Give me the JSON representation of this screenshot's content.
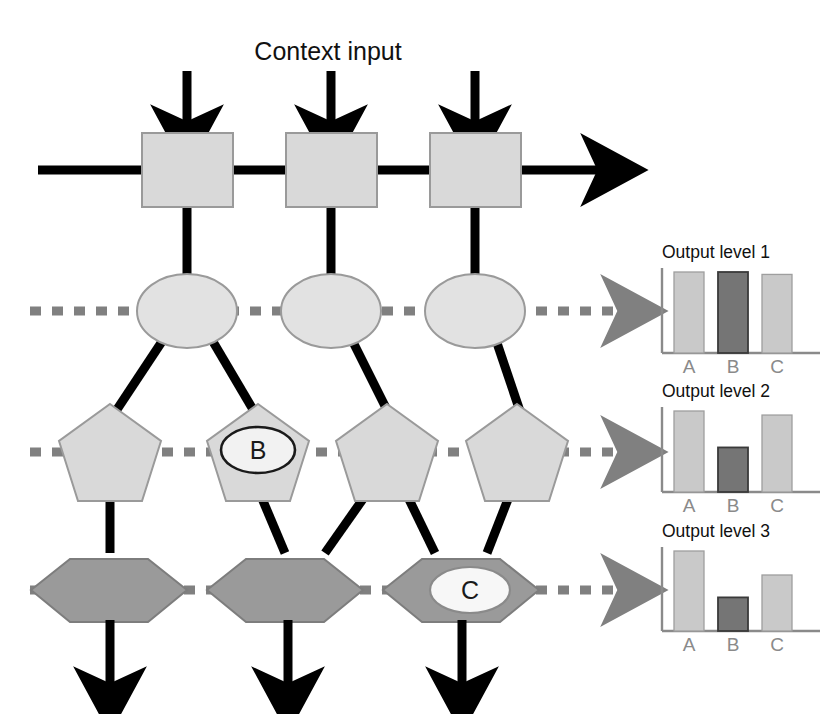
{
  "figure": {
    "context_label": "Context input",
    "colors": {
      "light_fill": "#d9d9d9",
      "dark_fill": "#9a9a9a",
      "stroke_black": "#000000",
      "stroke_gray": "#808080",
      "axis_gray": "#8a8a8a",
      "bar_light": "#c9c9c9",
      "bar_dark": "#757575",
      "background": "#ffffff"
    }
  },
  "layers": [
    {
      "name": "context-layer",
      "shape": "rectangle",
      "count": 3,
      "nodes": [
        {
          "id": "box-1",
          "label": ""
        },
        {
          "id": "box-2",
          "label": ""
        },
        {
          "id": "box-3",
          "label": ""
        }
      ]
    },
    {
      "name": "level-1-layer",
      "shape": "ellipse",
      "count": 3,
      "nodes": [
        {
          "id": "ellipse-1",
          "label": ""
        },
        {
          "id": "ellipse-2",
          "label": ""
        },
        {
          "id": "ellipse-3",
          "label": ""
        }
      ]
    },
    {
      "name": "level-2-layer",
      "shape": "pentagon",
      "count": 4,
      "nodes": [
        {
          "id": "pentagon-1",
          "label": ""
        },
        {
          "id": "pentagon-2",
          "label": "B"
        },
        {
          "id": "pentagon-3",
          "label": ""
        },
        {
          "id": "pentagon-4",
          "label": ""
        }
      ]
    },
    {
      "name": "level-3-layer",
      "shape": "hexagon",
      "count": 3,
      "nodes": [
        {
          "id": "hexagon-1",
          "label": ""
        },
        {
          "id": "hexagon-2",
          "label": ""
        },
        {
          "id": "hexagon-3",
          "label": "C"
        }
      ]
    }
  ],
  "node_labels": {
    "pentagon_b": "B",
    "hexagon_c": "C"
  },
  "chart_data": [
    {
      "id": "output-level-1",
      "type": "bar",
      "title": "Output level 1",
      "categories": [
        "A",
        "B",
        "C"
      ],
      "values": [
        100,
        100,
        97
      ],
      "ylim": [
        0,
        115
      ],
      "bar_styles": [
        "light",
        "dark",
        "light"
      ],
      "xlabel": "",
      "ylabel": "",
      "grid": false,
      "legend": false
    },
    {
      "id": "output-level-2",
      "type": "bar",
      "title": "Output level 2",
      "categories": [
        "A",
        "B",
        "C"
      ],
      "values": [
        100,
        55,
        95
      ],
      "ylim": [
        0,
        115
      ],
      "bar_styles": [
        "light",
        "dark",
        "light"
      ],
      "xlabel": "",
      "ylabel": "",
      "grid": false,
      "legend": false
    },
    {
      "id": "output-level-3",
      "type": "bar",
      "title": "Output level 3",
      "categories": [
        "A",
        "B",
        "C"
      ],
      "values": [
        100,
        42,
        70
      ],
      "ylim": [
        0,
        115
      ],
      "bar_styles": [
        "light",
        "dark",
        "light"
      ],
      "xlabel": "",
      "ylabel": "",
      "grid": false,
      "legend": false
    }
  ]
}
